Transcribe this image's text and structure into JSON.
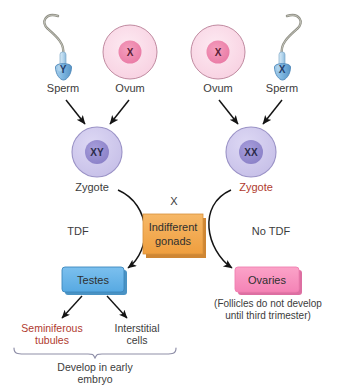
{
  "diagram": {
    "colors": {
      "sperm_head": "#7fb3de",
      "sperm_head_dark": "#3f7cae",
      "sperm_tail": "#8a8a80",
      "ovum_fill": "#fbdce8",
      "ovum_nucleus": "#ef89ad",
      "ovum_border": "#c98aa3",
      "zygote_fill": "#cfc9ec",
      "zygote_nucleus": "#9b92d4",
      "zygote_border": "#9b93c9",
      "gonad_box": "#f0a köp",
      "gonad_box_fill": "#f3a74d",
      "gonad_box_shadow": "#cf8633",
      "testes_fill": "#64b3e8",
      "testes_shadow": "#4a93c4",
      "ovaries_fill": "#f791bd",
      "ovaries_shadow": "#da6e9f",
      "arrow": "#1a1a1a",
      "red_text": "#b03a2e"
    },
    "gametes": [
      {
        "type": "sperm",
        "chromosome": "Y",
        "label": "Sperm",
        "side": "left-outer"
      },
      {
        "type": "ovum",
        "chromosome": "X",
        "label": "Ovum",
        "side": "left-inner"
      },
      {
        "type": "ovum",
        "chromosome": "X",
        "label": "Ovum",
        "side": "right-inner"
      },
      {
        "type": "sperm",
        "chromosome": "X",
        "label": "Sperm",
        "side": "right-outer"
      }
    ],
    "zygotes": [
      {
        "chromosome": "XY",
        "label": "Zygote",
        "label_color": "dark"
      },
      {
        "chromosome": "XX",
        "label": "Zygote",
        "label_color": "red"
      }
    ],
    "cross_marker": "X",
    "indifferent_gonads": "Indifferent\ngonads",
    "indifferent_gonads_line1": "Indifferent",
    "indifferent_gonads_line2": "gonads",
    "pathway_labels": {
      "left": "TDF",
      "right": "No TDF"
    },
    "outcomes": {
      "left": "Testes",
      "right": "Ovaries"
    },
    "ovaries_note_line1": "(Follicles do not develop",
    "ovaries_note_line2": "until third trimester)",
    "testes_children": [
      {
        "line1": "Seminiferous",
        "line2": "tubules",
        "color": "red"
      },
      {
        "line1": "Interstitial",
        "line2": "cells",
        "color": "dark"
      }
    ],
    "testes_footer_line1": "Develop in early",
    "testes_footer_line2": "embryo"
  }
}
